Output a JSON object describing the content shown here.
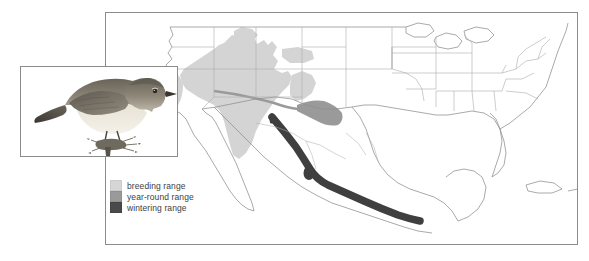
{
  "figure": {
    "type": "bird-range-map",
    "background_color": "#ffffff",
    "frame_color": "#8b8b8b"
  },
  "map": {
    "name": "north-america-range-map",
    "frame": {
      "x": 105,
      "y": 12,
      "width": 473,
      "height": 233
    },
    "outline_color": "#8a8a8a",
    "border_color": "#9a9a9a",
    "state_border_color": "#a8a8a8"
  },
  "legend": {
    "items": [
      {
        "label": "breeding range",
        "color": "#d6d6d6",
        "swatch_name": "breeding-range-swatch"
      },
      {
        "label": "year-round range",
        "color": "#9a9a9a",
        "swatch_name": "year-round-range-swatch"
      },
      {
        "label": "wintering range",
        "color": "#4a4a4a",
        "swatch_name": "wintering-range-swatch"
      }
    ]
  },
  "ranges": {
    "breeding": {
      "color": "#d6d6d6",
      "description": "Great Basin and Intermountain West: Nevada, Utah, eastern California, southern Idaho, western Colorado, Arizona, New Mexico"
    },
    "year_round": {
      "color": "#9a9a9a",
      "description": "Band along the Texas-Mexico border region and southern New Mexico"
    },
    "wintering": {
      "color": "#4a4a4a",
      "description": "Narrow band along the western Sierra Madre of Mexico from Sonora south to Oaxaca coast"
    }
  },
  "inset": {
    "name": "bird-illustration",
    "frame": {
      "x": 20,
      "y": 66,
      "width": 158,
      "height": 91
    },
    "subject": "small perched songbird on a twig, olive-gray back, pale buff underparts",
    "plumage_back_color": "#6f6a5f",
    "plumage_belly_color": "#e8e4d9"
  }
}
